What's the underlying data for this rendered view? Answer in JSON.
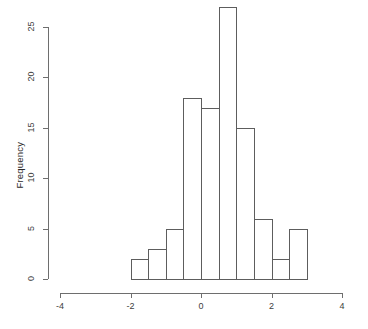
{
  "chart_data": {
    "type": "bar",
    "subtype": "histogram",
    "title": "",
    "xlabel": "",
    "ylabel": "Frequency",
    "xlim": [
      -4,
      4
    ],
    "ylim": [
      0,
      27
    ],
    "grid": false,
    "legend": null,
    "bin_width": 0.5,
    "bin_edges": [
      -2.0,
      -1.5,
      -1.0,
      -0.5,
      0.0,
      0.5,
      1.0,
      1.5,
      2.0,
      2.5,
      3.0
    ],
    "categories": [
      "-2.0 to -1.5",
      "-1.5 to -1.0",
      "-1.0 to -0.5",
      "-0.5 to 0.0",
      "0.0 to 0.5",
      "0.5 to 1.0",
      "1.0 to 1.5",
      "1.5 to 2.0",
      "2.0 to 2.5",
      "2.5 to 3.0"
    ],
    "values": [
      2,
      3,
      5,
      18,
      17,
      27,
      15,
      6,
      2,
      5
    ],
    "bars": [
      {
        "x0": -2.0,
        "x1": -1.5,
        "count": 2
      },
      {
        "x0": -1.5,
        "x1": -1.0,
        "count": 3
      },
      {
        "x0": -1.0,
        "x1": -0.5,
        "count": 5
      },
      {
        "x0": -0.5,
        "x1": 0.0,
        "count": 18
      },
      {
        "x0": 0.0,
        "x1": 0.5,
        "count": 17
      },
      {
        "x0": 0.5,
        "x1": 1.0,
        "count": 27
      },
      {
        "x0": 1.0,
        "x1": 1.5,
        "count": 15
      },
      {
        "x0": 1.5,
        "x1": 2.0,
        "count": 6
      },
      {
        "x0": 2.0,
        "x1": 2.5,
        "count": 2
      },
      {
        "x0": 2.5,
        "x1": 3.0,
        "count": 5
      }
    ],
    "x_ticks": [
      -4,
      -2,
      0,
      2,
      4
    ],
    "x_tick_labels": [
      "-4",
      "-2",
      "0",
      "2",
      "4"
    ],
    "y_ticks": [
      0,
      5,
      10,
      15,
      20,
      25
    ],
    "y_tick_labels": [
      "0",
      "5",
      "10",
      "15",
      "20",
      "25"
    ],
    "total_count": 100,
    "colors": {
      "bar_stroke": "#5d5d5d",
      "bar_fill": "transparent",
      "axis": "#6e6e6e",
      "text": "#2b2b2b",
      "background": "#ffffff"
    }
  },
  "axes": {
    "y_title": "Frequency",
    "x_title": ""
  }
}
